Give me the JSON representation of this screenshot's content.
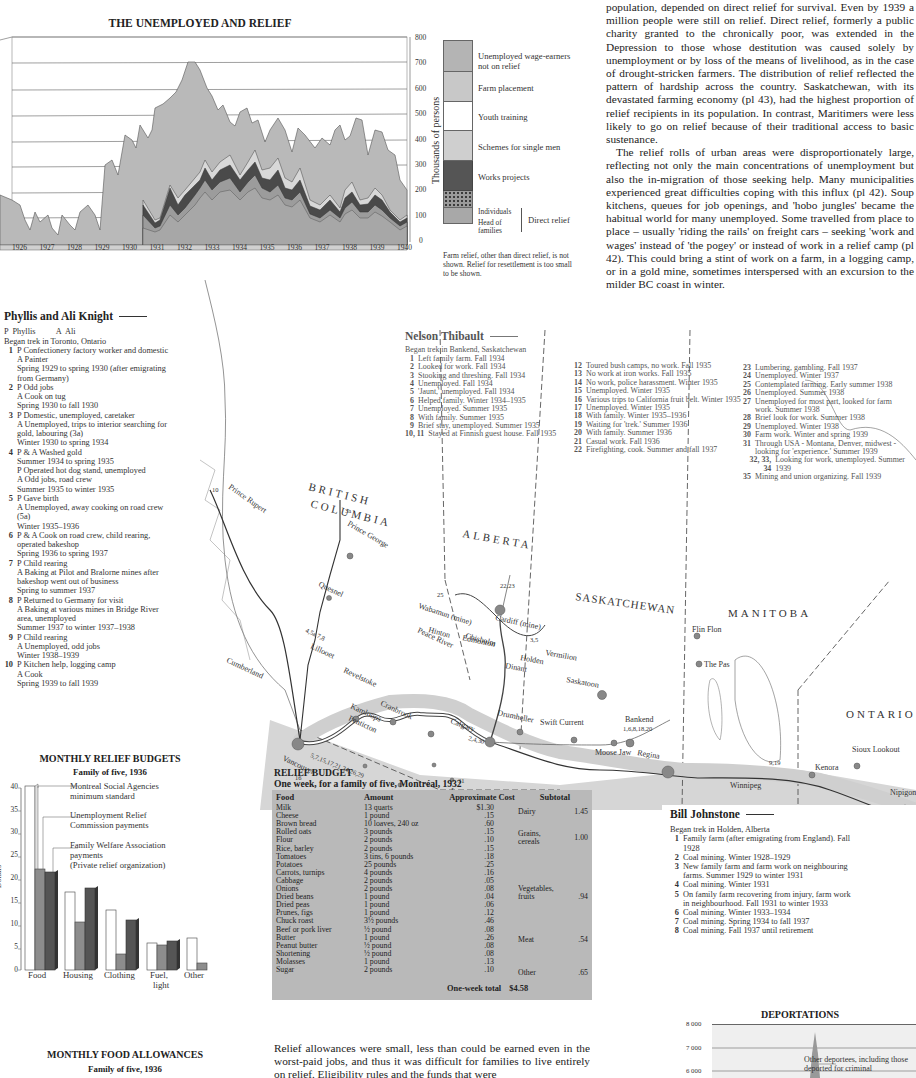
{
  "unemployed_chart": {
    "title": "THE UNEMPLOYED AND RELIEF",
    "ylabel": "Thousands of persons",
    "y_ticks": [
      "800",
      "700",
      "600",
      "500",
      "400",
      "300",
      "200",
      "100",
      "0"
    ],
    "x_ticks": [
      "1926",
      "1927",
      "1928",
      "1929",
      "1930",
      "1931",
      "1932",
      "1933",
      "1934",
      "1935",
      "1936",
      "1937",
      "1938",
      "1939",
      "1940"
    ],
    "legend": [
      {
        "label": "Unemployed wage-earners not on relief",
        "color": "#b4b4b4"
      },
      {
        "label": "Farm placement",
        "color": "#c8c8c8"
      },
      {
        "label": "Youth training",
        "color": "#ffffff"
      },
      {
        "label": "Schemes for single men",
        "color": "#cfcfcf"
      },
      {
        "label": "Works projects",
        "color": "#555555"
      },
      {
        "label": "Individuals",
        "color": "#9a9a9a"
      },
      {
        "label": "Head of families",
        "color": "#a8a8a8"
      }
    ],
    "direct_relief_label": "Direct relief",
    "note": "Farm relief, other than direct relief, is not shown. Relief for resettlement is too small to be shown."
  },
  "chart_data": [
    {
      "type": "area",
      "title": "THE UNEMPLOYED AND RELIEF",
      "xlabel": "",
      "ylabel": "Thousands of persons",
      "ylim": [
        0,
        800
      ],
      "x": [
        "1926",
        "1927",
        "1928",
        "1929",
        "1930",
        "1931",
        "1932",
        "1933",
        "1934",
        "1935",
        "1936",
        "1937",
        "1938",
        "1939",
        "1940"
      ],
      "series": [
        {
          "name": "Total unemployed (top of stack)",
          "values": [
            130,
            100,
            120,
            200,
            400,
            560,
            720,
            600,
            530,
            490,
            440,
            420,
            470,
            380,
            160
          ]
        },
        {
          "name": "Total on relief",
          "values": [
            0,
            0,
            0,
            0,
            0,
            110,
            180,
            360,
            390,
            350,
            250,
            200,
            220,
            200,
            90
          ]
        },
        {
          "name": "Direct relief",
          "values": [
            0,
            0,
            0,
            0,
            0,
            80,
            140,
            280,
            270,
            260,
            220,
            150,
            160,
            170,
            80
          ]
        }
      ],
      "legend_position": "right",
      "grid": true
    },
    {
      "type": "bar",
      "title": "MONTHLY RELIEF BUDGETS",
      "subtitle": "Family of five, 1936",
      "ylabel": "Dollars",
      "ylim": [
        0,
        40
      ],
      "categories": [
        "Food",
        "Housing",
        "Clothing",
        "Fuel, light",
        "Other"
      ],
      "series": [
        {
          "name": "Montreal Social Agencies minimum standard",
          "values": [
            40.5,
            17,
            13,
            6,
            7
          ]
        },
        {
          "name": "Unemployment Relief Commission payments",
          "values": [
            22,
            10.5,
            3.5,
            5.5,
            1.5
          ]
        },
        {
          "name": "Family Welfare Association payments (Private relief organization)",
          "values": [
            21.5,
            18,
            11,
            6.5,
            0
          ]
        }
      ],
      "grid": false
    },
    {
      "type": "table",
      "title": "RELIEF BUDGET",
      "subtitle": "One week, for a family of five, Montréal, 1932",
      "columns": [
        "Food",
        "Amount",
        "Approximate Cost"
      ],
      "total": "$4.58"
    }
  ],
  "intro_text": {
    "p1": "population, depended on direct relief for survival. Even by 1939 a million people were still on relief. Direct relief, formerly a public charity granted to the chronically poor, was extended in the Depression to those whose destitution was caused solely by unemployment or by loss of the means of livelihood, as in the case of drought-stricken farmers. The distribution of relief reflected the pattern of hardship across the country. Saskatchewan, with its devastated farming economy (pl 43), had the highest proportion of relief recipients in its population. In contrast, Maritimers were less likely to go on relief because of their traditional access to basic sustenance.",
    "p2": "The relief rolls of urban areas were disproportionately large, reflecting not only the main concentrations of unemployment but also the in-migration of those seeking help. Many municipalities experienced great difficulties coping with this influx (pl 42). Soup kitchens, queues for job openings, and 'hobo jungles' became the habitual world for many unemployed. Some travelled from place to place – usually 'riding the rails' on freight cars – seeking 'work and wages' instead of 'the pogey' or instead of work in a relief camp (pl 42). This could bring a stint of work on a farm, in a logging camp, or in a gold mine, sometimes interspersed with an excursion to the milder BC coast in winter."
  },
  "knight": {
    "title": "Phyllis and Ali Knight",
    "key": "P  Phyllis          A  Ali",
    "start": "Began trek in Toronto, Ontario",
    "entries": [
      {
        "n": "1",
        "lines": [
          "P  Confectionery factory worker and domestic",
          "A  Painter",
          "Spring 1929 to spring 1930 (after emigrating",
          "from Germany)"
        ]
      },
      {
        "n": "2",
        "lines": [
          "P  Odd jobs",
          "A  Cook on tug",
          "Spring 1930 to fall 1930"
        ]
      },
      {
        "n": "3",
        "lines": [
          "P  Domestic, unemployed, caretaker",
          "A  Unemployed, trips to interior searching for",
          "gold, labouring (3a)",
          "Winter 1930 to spring 1934"
        ]
      },
      {
        "n": "4",
        "lines": [
          "P & A  Washed gold",
          "Summer 1934 to spring 1935",
          "P  Operated hot dog stand, unemployed",
          "A  Odd jobs, road crew",
          "Summer 1935 to winter 1935"
        ]
      },
      {
        "n": "5",
        "lines": [
          "P  Gave birth",
          "A  Unemployed, away cooking on road crew",
          "(5a)",
          "Winter 1935–1936"
        ]
      },
      {
        "n": "6",
        "lines": [
          "P & A  Cook on road crew, child rearing,",
          "operated bakeshop",
          "Spring 1936 to spring 1937"
        ]
      },
      {
        "n": "7",
        "lines": [
          "P  Child rearing",
          "A  Baking at Pilot and Bralorne mines after",
          "bakeshop went out of business",
          "Spring to summer 1937"
        ]
      },
      {
        "n": "8",
        "lines": [
          "P  Returned to Germany for visit",
          "A  Baking at various mines in Bridge River",
          "area, unemployed",
          "Summer 1937 to winter 1937–1938"
        ]
      },
      {
        "n": "9",
        "lines": [
          "P  Child rearing",
          "A  Unemployed, odd jobs",
          "Winter 1938–1939"
        ]
      },
      {
        "n": "10",
        "lines": [
          "P  Kitchen help, logging camp",
          "A  Cook",
          "Spring 1939 to fall 1939"
        ]
      }
    ]
  },
  "thibault": {
    "title": "Nelson Thibault",
    "start": "Began trek in Bankend, Saskatchewan",
    "col1": [
      {
        "n": "1",
        "t": "Left family farm. Fall 1934"
      },
      {
        "n": "2",
        "t": "Looked for work. Fall 1934"
      },
      {
        "n": "3",
        "t": "Stooking and threshing. Fall 1934"
      },
      {
        "n": "4",
        "t": "Unemployed. Fall 1934"
      },
      {
        "n": "5",
        "t": "'Jaunt,' unemployed. Fall 1934"
      },
      {
        "n": "6",
        "t": "Helped family. Winter 1934–1935"
      },
      {
        "n": "7",
        "t": "Unemployed. Summer 1935"
      },
      {
        "n": "8",
        "t": "With family. Summer 1935"
      },
      {
        "n": "9",
        "t": "Brief stay, unemployed. Summer 1935"
      },
      {
        "n": "10, 11",
        "t": "Stayed at Finnish guest house. Fall 1935"
      }
    ],
    "col2": [
      {
        "n": "12",
        "t": "Toured bush camps, no work. Fall 1935"
      },
      {
        "n": "13",
        "t": "No work at iron works. Fall 1935"
      },
      {
        "n": "14",
        "t": "No work, police harassment. Winter 1935"
      },
      {
        "n": "15",
        "t": "Unemployed. Winter 1935"
      },
      {
        "n": "16",
        "t": "Various trips to California fruit belt. Winter 1935"
      },
      {
        "n": "17",
        "t": "Unemployed. Winter 1935"
      },
      {
        "n": "18",
        "t": "With family. Winter 1935–1936"
      },
      {
        "n": "19",
        "t": "Waiting for 'trek.' Summer 1936"
      },
      {
        "n": "20",
        "t": "With family. Summer 1936"
      },
      {
        "n": "21",
        "t": "Casual work. Fall 1936"
      },
      {
        "n": "22",
        "t": "Firefighting, cook. Summer and fall 1937"
      }
    ],
    "col3": [
      {
        "n": "23",
        "t": "Lumbering, gambling. Fall 1937"
      },
      {
        "n": "24",
        "t": "Unemployed. Winter 1937"
      },
      {
        "n": "25",
        "t": "Contemplated farming. Early summer 1938"
      },
      {
        "n": "26",
        "t": "Unemployed. Summer 1938"
      },
      {
        "n": "27",
        "t": "Unemployed for most part, looked for farm work. Summer 1938"
      },
      {
        "n": "28",
        "t": "Brief look for work. Summer 1938"
      },
      {
        "n": "29",
        "t": "Unemployed. Winter 1938"
      },
      {
        "n": "30",
        "t": "Farm work. Winter and spring 1939"
      },
      {
        "n": "31",
        "t": "Through USA - Montana, Denver, midwest - looking for 'experience.' Summer 1939"
      },
      {
        "n": "32, 33, 34",
        "t": "Looking for work, unemployed. Summer 1939"
      },
      {
        "n": "35",
        "t": "Mining and union organizing. Fall 1939"
      }
    ]
  },
  "johnstone": {
    "title": "Bill Johnstone",
    "start": "Began trek in Holden, Alberta",
    "entries": [
      {
        "n": "1",
        "t": "Family farm (after emigrating from England). Fall 1928"
      },
      {
        "n": "2",
        "t": "Coal mining. Winter 1928–1929"
      },
      {
        "n": "3",
        "t": "New family farm and farm work on neighbouring farms. Summer 1929 to winter 1931"
      },
      {
        "n": "4",
        "t": "Coal mining. Winter 1931"
      },
      {
        "n": "5",
        "t": "On family farm recovering from injury, farm work in neighbourhood. Fall 1931 to winter 1933"
      },
      {
        "n": "6",
        "t": "Coal mining. Winter 1933–1934"
      },
      {
        "n": "7",
        "t": "Coal mining. Spring 1934 to fall 1937"
      },
      {
        "n": "8",
        "t": "Coal mining. Fall 1937 until retirement"
      }
    ]
  },
  "map": {
    "provinces": [
      "BRITISH",
      "COLUMBIA",
      "ALBERTA",
      "SASKATCHEWAN",
      "MANITOBA",
      "ONTARIO"
    ],
    "places": {
      "prince_rupert": "Prince Rupert",
      "prince_george": "Prince George",
      "quesnel": "Quesnel",
      "lillooet": "Lillooet",
      "cumberland": "Cumberland",
      "vancouver": "Vancouver",
      "kamloops": "Kamloops",
      "revelstoke": "Revelstoke",
      "penticton": "Penticton",
      "cranbrook": "Cranbrook",
      "calgary": "Calgary",
      "peace_river": "Peace River",
      "chisholm": "Chisholm",
      "wabamun": "Wabamun (mine)",
      "cardiff": "Cardiff (mine)",
      "hinton": "Hinton",
      "edmonton": "Edmonton",
      "vermilion": "Vermilion",
      "holden": "Holden",
      "dinant": "Dinant",
      "drumheller": "Drumheller",
      "lethbridge": "Lethbridge",
      "saskatoon": "Saskatoon",
      "swift_current": "Swift Current",
      "moose_jaw": "Moose Jaw",
      "regina": "Regina",
      "bankend": "Bankend",
      "flin_flon": "Flin Flon",
      "the_pas": "The Pas",
      "winnipeg": "Winnipeg",
      "kenora": "Kenora",
      "sioux_lookout": "Sioux Lookout",
      "nipigon": "Nipigon",
      "fort_arthur": "Port Arthur Fort William"
    },
    "route_labels": {
      "r_3a": "3a",
      "r_10": "10",
      "r_lil": "4,5a 7,8",
      "r_chis": "22,23",
      "r_peace": "25",
      "r_verm": "3,5",
      "r_van": "5,7,15,17,21,24,26,29",
      "r_cal": "2,4,30",
      "r_bank": "1,6,8,18,20",
      "r_win": "9,19",
      "r_16": "16",
      "r_31": "31"
    }
  },
  "budgets_legend": {
    "title": "MONTHLY RELIEF BUDGETS",
    "subtitle": "Family of five, 1936",
    "y_ticks": [
      "40",
      "35",
      "30",
      "25",
      "20",
      "15",
      "10",
      "5",
      "0"
    ],
    "ylabel": "Dollars",
    "s1": "Montreal Social Agencies minimum standard",
    "s2": "Unemployment Relief Commission payments",
    "s3a": "Family Welfare Association payments",
    "s3b": "(Private relief organization)",
    "categories": [
      "Food",
      "Housing",
      "Clothing",
      "Fuel,",
      "Other"
    ],
    "fuel_line2": "light"
  },
  "relief_budget": {
    "title": "RELIEF BUDGET",
    "subtitle": "One week, for a family of five, Montréal, 1932",
    "headers": {
      "food": "Food",
      "amount": "Amount",
      "cost": "Approximate Cost",
      "subtotal": "Subtotal"
    },
    "rows": [
      {
        "food": "Milk",
        "amount": "13 quarts",
        "cost": "$1.30"
      },
      {
        "food": "Cheese",
        "amount": "1 pound",
        "cost": ".15"
      },
      {
        "food": "Brown bread",
        "amount": "10 loaves, 240 oz",
        "cost": ".60"
      },
      {
        "food": "Rolled oats",
        "amount": "3 pounds",
        "cost": ".15"
      },
      {
        "food": "Flour",
        "amount": "2 pounds",
        "cost": ".10"
      },
      {
        "food": "Rice, barley",
        "amount": "2 pounds",
        "cost": ".15"
      },
      {
        "food": "Tomatoes",
        "amount": "3 tins, 6 pounds",
        "cost": ".18"
      },
      {
        "food": "Potatoes",
        "amount": "25 pounds",
        "cost": ".25"
      },
      {
        "food": "Carrots, turnips",
        "amount": "4 pounds",
        "cost": ".16"
      },
      {
        "food": "Cabbage",
        "amount": "2 pounds",
        "cost": ".05"
      },
      {
        "food": "Onions",
        "amount": "2 pounds",
        "cost": ".08"
      },
      {
        "food": "Dried beans",
        "amount": "1 pound",
        "cost": ".04"
      },
      {
        "food": "Dried peas",
        "amount": "1 pound",
        "cost": ".06"
      },
      {
        "food": "Prunes, figs",
        "amount": "1 pound",
        "cost": ".12"
      },
      {
        "food": "Chuck roast",
        "amount": "3½ pounds",
        "cost": ".46"
      },
      {
        "food": "Beef or pork liver",
        "amount": "½ pound",
        "cost": ".08"
      },
      {
        "food": "Butter",
        "amount": "1 pound",
        "cost": ".26"
      },
      {
        "food": "Peanut butter",
        "amount": "½ pound",
        "cost": ".08"
      },
      {
        "food": "Shortening",
        "amount": "½ pound",
        "cost": ".08"
      },
      {
        "food": "Molasses",
        "amount": "1 pound",
        "cost": ".13"
      },
      {
        "food": "Sugar",
        "amount": "2 pounds",
        "cost": ".10"
      }
    ],
    "subtotals": [
      {
        "label": "Dairy",
        "value": "1.45"
      },
      {
        "label": "Grains, cereals",
        "value": "1.00"
      },
      {
        "label": "Vegetables, fruits",
        "value": ".94"
      },
      {
        "label": "Meat",
        "value": ".54"
      },
      {
        "label": "Other",
        "value": ".65"
      }
    ],
    "total_label": "One-week total",
    "total_value": "$4.58"
  },
  "food_allowances": {
    "title": "MONTHLY FOOD ALLOWANCES",
    "subtitle": "Family of five, 1936"
  },
  "bottom_text": "Relief allowances were small, less than could be earned even in the worst-paid jobs, and thus it was difficult for families to live entirely on relief. Eligibility rules and the funds that were",
  "deportations": {
    "title": "DEPORTATIONS",
    "y_ticks": [
      "8 000",
      "7 000",
      "6 000"
    ],
    "label": "Other deportees, including those deported for criminal"
  }
}
